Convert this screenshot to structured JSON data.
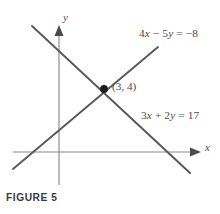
{
  "figure": {
    "caption": "FIGURE 5",
    "axis_x_label": "x",
    "axis_y_label": "y",
    "point_label": "(3, 4)",
    "equation_top": "4x − 5y = −8",
    "equation_bottom": "3x + 2y = 17",
    "colors": {
      "axis": "#8a8a8a",
      "line": "#58585a",
      "text": "#4c4c4e",
      "point": "#1d1d1f",
      "caption": "#3a3a3c",
      "background": "#ffffff"
    }
  },
  "chart_data": {
    "type": "line",
    "title": "FIGURE 5",
    "xlabel": "x",
    "ylabel": "y",
    "grid": false,
    "legend": "none",
    "axes": {
      "origin_px": [
        59,
        152
      ],
      "x_axis_px": [
        [
          13,
          152
        ],
        [
          196,
          152
        ]
      ],
      "y_axis_px": [
        [
          59,
          185
        ],
        [
          59,
          27
        ]
      ]
    },
    "series": [
      {
        "name": "4x − 5y = −8",
        "equation": "4x - 5y = -8",
        "slope": 0.8,
        "intercept": 1.6,
        "label": "4x − 5y = −8",
        "endpoints_px": [
          [
            13,
            169
          ],
          [
            158,
            47
          ]
        ]
      },
      {
        "name": "3x + 2y = 17",
        "equation": "3x + 2y = 17",
        "slope": -1.5,
        "intercept": 8.5,
        "label": "3x + 2y = 17",
        "endpoints_px": [
          [
            32,
            26
          ],
          [
            190,
            173
          ]
        ]
      }
    ],
    "annotations": [
      {
        "text": "(3, 4)",
        "x": 3,
        "y": 4,
        "px": [
          104,
          89
        ],
        "type": "intersection-point"
      }
    ]
  }
}
